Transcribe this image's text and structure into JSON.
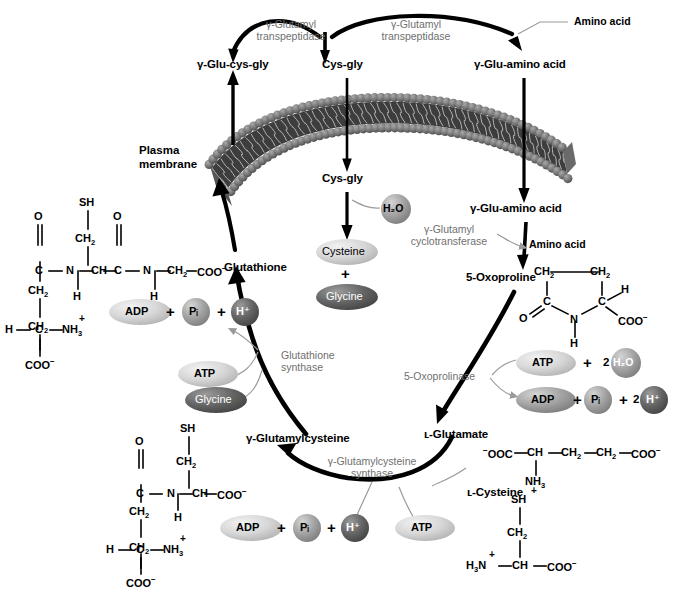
{
  "diagram": {
    "membrane_label_line1": "Plasma",
    "membrane_label_line2": "membrane"
  },
  "metabolites": {
    "glu_cys_gly": "γ-Glu-cys-gly",
    "cys_gly_top": "Cys-gly",
    "glu_amino_acid_top": "γ-Glu-amino acid",
    "cys_gly_inner": "Cys-gly",
    "glu_amino_acid_inner": "γ-Glu-amino acid",
    "oxoproline": "5-Oxoproline",
    "glutathione": "Glutathione",
    "glutamylcysteine": "γ-Glutamylcysteine",
    "glutamate": "ʟ-Glutamate",
    "cysteine_label": "ʟ-Cysteine",
    "amino_acid_top": "Amino acid",
    "amino_acid_mid": "Amino acid"
  },
  "enzymes": {
    "transpeptidase_left_l1": "γ-Glutamyl",
    "transpeptidase_left_l2": "transpeptidase",
    "transpeptidase_right_l1": "γ-Glutamyl",
    "transpeptidase_right_l2": "transpeptidase",
    "cyclotransferase_l1": "γ-Glutamyl",
    "cyclotransferase_l2": "cyclotransferase",
    "oxoprolinase": "5-Oxoprolinase",
    "gsh_synthase_l1": "Glutathione",
    "gsh_synthase_l2": "synthase",
    "gcs_synthase_l1": "γ-Glutamylcysteine",
    "gcs_synthase_l2": "synthase"
  },
  "bubbles": {
    "h2o_top": "H₂O",
    "cysteine": "Cysteine",
    "glycine_top": "Glycine",
    "atp_gsh": "ATP",
    "glycine_gsh": "Glycine",
    "adp_gsh": "ADP",
    "pi_gsh": "Pᵢ",
    "h_gsh": "H⁺",
    "atp_oxp": "ATP",
    "h2o_oxp": "H₂O",
    "adp_oxp": "ADP",
    "pi_oxp": "Pᵢ",
    "h_oxp": "H⁺",
    "adp_gcs": "ADP",
    "pi_gcs": "Pᵢ",
    "h_gcs": "H⁺",
    "atp_gcs": "ATP"
  },
  "operators": {
    "plus": "+",
    "two": "2"
  },
  "structures": {
    "glutathione": {
      "name": "glutathione-structure",
      "atoms": [
        "SH",
        "CH₂",
        "O",
        "C",
        "N",
        "H",
        "CH",
        "O",
        "C",
        "N",
        "H",
        "CH₂",
        "COO⁻",
        "CH₂",
        "CH₂",
        "H",
        "C",
        "NH₃⁺",
        "COO⁻"
      ]
    },
    "glutamylcysteine": {
      "name": "glutamylcysteine-structure",
      "atoms": [
        "SH",
        "CH₂",
        "O",
        "C",
        "N",
        "H",
        "CH",
        "COO⁻",
        "CH₂",
        "CH₂",
        "H",
        "C",
        "NH₃⁺",
        "COO⁻"
      ]
    },
    "oxoproline": {
      "name": "oxoproline-structure",
      "atoms": [
        "CH₂",
        "CH₂",
        "C",
        "C",
        "H",
        "O",
        "N",
        "COO⁻",
        "H"
      ]
    },
    "glutamate": {
      "name": "glutamate-structure",
      "atoms": [
        "⁻OOC",
        "CH",
        "CH₂",
        "CH₂",
        "COO⁻",
        "NH₃⁺"
      ]
    },
    "cysteine": {
      "name": "cysteine-structure",
      "atoms": [
        "SH",
        "CH₂",
        "H₃N⁺",
        "CH",
        "COO⁻"
      ]
    }
  },
  "colors": {
    "arrow_black": "#000000",
    "enzyme_gray": "#6f6f6f",
    "thin_connector": "#9a9a9a",
    "bubble_light": "#d6d6d6",
    "bubble_mid": "#9e9e9e",
    "bubble_dark": "#5e5e5e",
    "membrane_head": "#6b6b6b",
    "membrane_core": "#3a3a3a",
    "background": "#ffffff"
  }
}
